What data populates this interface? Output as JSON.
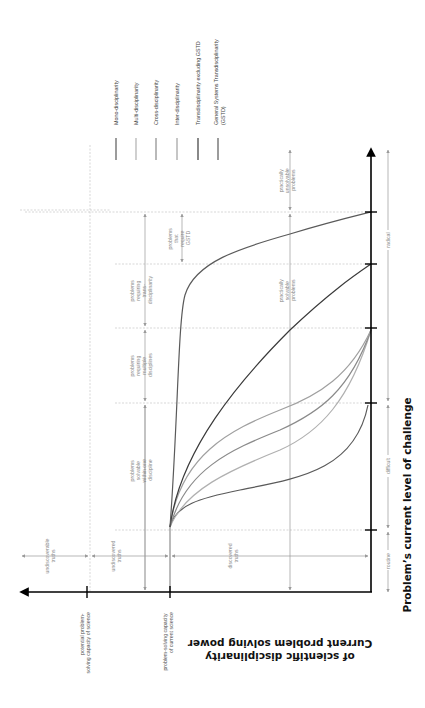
{
  "legend": {
    "items": [
      {
        "label": "Mono-disciplinarity",
        "color": "#5a5a5a"
      },
      {
        "label": "Multi-disciplinarity",
        "color": "#b0b0b0"
      },
      {
        "label": "Cross-disciplinarity",
        "color": "#8a8a8a"
      },
      {
        "label": "Inter-disciplinarity",
        "color": "#a0a0a0"
      },
      {
        "label": "Transdisciplinarity excluding GSTD",
        "color": "#3a3a3a"
      },
      {
        "label": "General Systems Transdisciplinarity",
        "label2": "(GSTD)",
        "color": "#5a5a5a"
      }
    ]
  },
  "axes": {
    "vertical_title": "Problem’s current level of challenge",
    "horizontal_title_line1": "Current problem solving power",
    "horizontal_title_line2": "of scientific disciplinarity",
    "horizontal_ticks": [
      {
        "line1": "potential problem-",
        "line2": "solving capacity of science"
      },
      {
        "line1": "problem-solving capacity",
        "line2": "of current science"
      }
    ]
  },
  "challenge_levels": {
    "routine": "routine",
    "difficult": "difficult",
    "radical": "radical"
  },
  "truths": {
    "undiscoverable": [
      "undiscoverable",
      "truths"
    ],
    "undiscovered": [
      "undiscovered",
      "truths"
    ],
    "discovered": [
      "discovered",
      "truths"
    ]
  },
  "problem_classes": {
    "one_discipline": [
      "problems",
      "solvable",
      "within one",
      "discipline"
    ],
    "multiple": [
      "problems",
      "requiring",
      "multiple",
      "disciplines"
    ],
    "trans": [
      "problems",
      "requiring",
      "trans-",
      "disciplinarity"
    ],
    "gstd": [
      "problems",
      "that",
      "require",
      "GSTD"
    ]
  },
  "solvability": {
    "solvable": [
      "practically",
      "solvable",
      "problems"
    ],
    "unsolvable": [
      "practically",
      "unsolvable",
      "problems"
    ]
  },
  "colors": {
    "axis": "#000000",
    "guide": "#9a9a9a",
    "dashed": "#bdbdbd"
  }
}
